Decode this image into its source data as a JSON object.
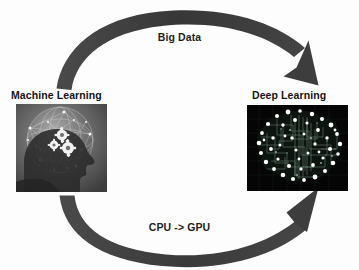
{
  "diagram": {
    "background_color": "#fdfdfd",
    "arrow_color": "#3f3f3f",
    "text_color": "#141414"
  },
  "arrows": {
    "top": {
      "label": "Big Data",
      "direction": "left-to-right",
      "from": "Machine Learning",
      "to": "Deep Learning",
      "icon": "curved-arrow-right-icon"
    },
    "bottom": {
      "label": "CPU -> GPU",
      "direction": "left-to-right",
      "from": "Machine Learning",
      "to": "Deep Learning",
      "icon": "curved-arrow-right-icon"
    }
  },
  "nodes": [
    {
      "id": "machine-learning",
      "title": "Machine Learning",
      "image_description": "grayscale human head profile silhouette with wireframe network sphere and white gears",
      "image_style": "grayscale"
    },
    {
      "id": "deep-learning",
      "title": "Deep Learning",
      "image_description": "black background brain formed from circuit board traces with bright white node dots",
      "image_style": "black-and-white"
    }
  ]
}
